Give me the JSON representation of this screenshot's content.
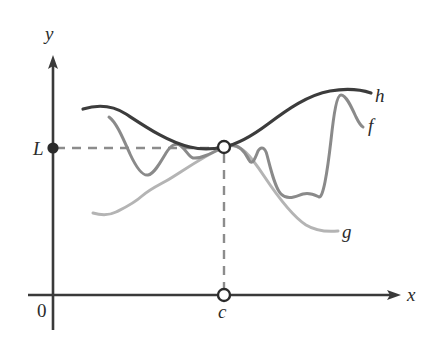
{
  "figure": {
    "width": 435,
    "height": 340,
    "background": "#ffffff"
  },
  "axes": {
    "x_axis": {
      "label": "x",
      "color": "#3a3a3a",
      "y_pixel": 295,
      "x_start": 28,
      "x_end": 400,
      "arrow": "right"
    },
    "y_axis": {
      "label": "y",
      "color": "#3a3a3a",
      "x_pixel": 53,
      "y_start": 330,
      "y_end": 57,
      "arrow": "up"
    },
    "origin_label": "0"
  },
  "markers": {
    "limit_value": {
      "label": "L",
      "style": "filled-dot",
      "color": "#2b2b2b",
      "x": 53,
      "y": 148
    },
    "limit_point": {
      "label": "",
      "style": "open-circle",
      "color": "#2b2b2b",
      "x": 224,
      "y": 147,
      "radius": 6
    },
    "x_value": {
      "label": "c",
      "style": "open-circle",
      "color": "#2b2b2b",
      "x": 224,
      "y": 295,
      "radius": 6
    }
  },
  "guides": {
    "horizontal_dashed": {
      "from_x": 53,
      "to_x": 224,
      "y": 148,
      "color": "#8c8c8c",
      "dash": "9,7"
    },
    "vertical_dashed": {
      "x": 224,
      "from_y": 153,
      "to_y": 290,
      "color": "#8c8c8c",
      "dash": "9,7"
    }
  },
  "curves": [
    {
      "name": "h",
      "label": "h",
      "role": "upper-bound",
      "color": "#3c3c3c",
      "stroke_width": 3.2,
      "path": "M 83,109 C 96,105 112,105 126,114 C 146,127 168,142 190,147 C 202,150 214,149 224,147 C 238,144 252,136 268,124 C 288,109 308,95 330,91 C 348,88 362,90 371,93"
    },
    {
      "name": "f",
      "label": "f",
      "role": "oscillating-function",
      "color": "#8a8a8a",
      "stroke_width": 3.0,
      "path": "M 109,117 C 116,122 122,136 130,154 C 137,169 143,176 148,175 C 154,174 160,163 166,153 C 171,145 176,142 181,146 C 186,150 189,157 193,158 C 200,159 210,154 224,147 C 236,141 244,150 249,160 C 252,166 255,159 258,151 C 261,146 265,147 267,155 C 271,170 275,188 281,194 C 288,201 296,196 303,194 C 310,192 315,195 319,197 C 323,198 327,175 331,140 C 334,112 337,95 341,95 C 346,95 351,106 356,117 C 359,123 361,126 363,127"
    },
    {
      "name": "g",
      "label": "g",
      "role": "lower-bound",
      "color": "#b4b4b4",
      "stroke_width": 3.0,
      "path": "M 93,213 C 100,215 108,216 116,212 C 126,207 133,204 142,196 C 150,189 157,186 166,181 C 180,173 200,158 224,147 C 240,140 252,158 264,176 C 278,197 292,216 306,225 C 316,231 328,232 338,231"
    }
  ],
  "legend": {
    "h_label": "h",
    "f_label": "f",
    "g_label": "g"
  },
  "chart_data": {
    "type": "line",
    "xlabel": "x",
    "ylabel": "y",
    "grid": false,
    "legend_position": "right-of-curve-ends",
    "annotations": [
      "L",
      "c",
      "0"
    ],
    "series": [
      {
        "name": "h",
        "role": "upper bound",
        "color": "#3c3c3c"
      },
      {
        "name": "f",
        "role": "squeezed function",
        "color": "#8a8a8a"
      },
      {
        "name": "g",
        "role": "lower bound",
        "color": "#b4b4b4"
      }
    ],
    "key_point": {
      "x_label": "c",
      "y_label": "L",
      "marker": "open-circle"
    }
  }
}
